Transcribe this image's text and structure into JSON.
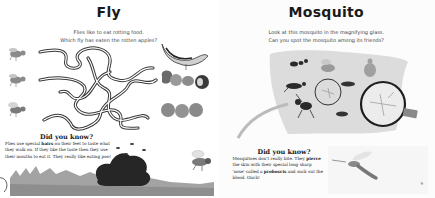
{
  "left_page": {
    "title": "Fly",
    "intro": {
      "line1": "Flies like to eat rotting food.",
      "line2": "Which fly has eaten the rotten apples?"
    },
    "maze": {
      "flies": [
        "fly-1",
        "fly-2",
        "fly-3"
      ],
      "foods": [
        "banana-peel",
        "rotten-apples",
        "fresh-apples"
      ]
    },
    "did_you_know": {
      "heading": "Did you know?",
      "text_before": "Flies use special ",
      "bold_word": "hairs",
      "text_after": " on their feet to taste what they walk on. If they like the taste then they use their mouths to eat it. They really like eating poo!"
    }
  },
  "right_page": {
    "title": "Mosquito",
    "intro": {
      "line1": "Look at this mosquito in the magnifying glass.",
      "line2": "Can you spot the mosquito among its friends?"
    },
    "did_you_know": {
      "heading": "Did you know?",
      "text_part1": "Mosquitoes don't really bite. They ",
      "bold1": "pierce",
      "text_part2": " the skin with their special long sharp 'nose' called a ",
      "bold2": "proboscis",
      "text_part3": " and suck out the blood. Ouch!"
    },
    "page_number": "9"
  },
  "colors": {
    "ink": "#1a1a1a",
    "grey_insect": "#8a8a8a",
    "leaf": "#d8d8d8",
    "grass": "#9a9a9a",
    "poo": "#2a2a2a",
    "lens_rim": "#1e1e1e"
  }
}
